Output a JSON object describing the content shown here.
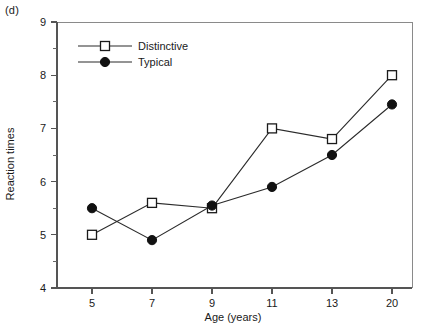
{
  "panel": {
    "label": "(d)"
  },
  "chart_data": {
    "type": "line",
    "title": "",
    "xlabel": "Age (years)",
    "ylabel": "Reaction times",
    "categories": [
      "5",
      "7",
      "9",
      "11",
      "13",
      "20"
    ],
    "x_tick_labels": [
      "5",
      "7",
      "9",
      "11",
      "13",
      "20"
    ],
    "y_tick_labels": [
      "4",
      "5",
      "6",
      "7",
      "8",
      "9"
    ],
    "y_ticks": [
      4,
      5,
      6,
      7,
      8,
      9
    ],
    "y_minor_ticks": [
      4.5,
      5.5,
      6.5,
      7.5,
      8.5
    ],
    "ylim": [
      4,
      9
    ],
    "grid": false,
    "legend_position": "top-left",
    "series": [
      {
        "name": "Distinctive",
        "marker": "open-square",
        "values": [
          5.0,
          5.6,
          5.5,
          7.0,
          6.8,
          8.0
        ]
      },
      {
        "name": "Typical",
        "marker": "filled-circle",
        "values": [
          5.5,
          4.9,
          5.55,
          5.9,
          6.5,
          7.45
        ]
      }
    ]
  },
  "legend": {
    "items": [
      {
        "label": "Distinctive",
        "marker": "open-square"
      },
      {
        "label": "Typical",
        "marker": "filled-circle"
      }
    ]
  },
  "colors": {
    "line": "#2b2b2b",
    "marker_fill": "#111111",
    "marker_open_fill": "#ffffff",
    "axis": "#555555",
    "frame": "#8a8a8a",
    "text": "#1a1a1a",
    "background": "#ffffff"
  }
}
